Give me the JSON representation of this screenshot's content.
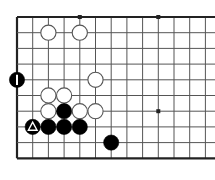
{
  "diagram": {
    "type": "go-board",
    "board": {
      "background_color": "#ffffff",
      "line_color": "#555555",
      "edge_line_color": "#222222",
      "edge_line_width": 2.2,
      "line_width": 1.0,
      "spacing": 15.7,
      "origin_x": 17,
      "origin_y": 17,
      "cols": 13,
      "rows": 10,
      "left_edge": true,
      "top_edge": true,
      "bottom_edge": true,
      "right_edge": false
    },
    "star_points": [
      {
        "col": 4,
        "row": 0
      },
      {
        "col": 9,
        "row": 0
      },
      {
        "col": 9,
        "row": 6
      }
    ],
    "star_point_radius": 2.0,
    "stone_radius": 7.6,
    "colors": {
      "black_stone": "#000000",
      "white_stone": "#ffffff",
      "white_stone_border": "#555555",
      "mark_on_black": "#ffffff",
      "star_point": "#222222"
    },
    "stones": [
      {
        "id": "w-c2r1",
        "color": "white",
        "col": 2,
        "row": 1,
        "mark": "none"
      },
      {
        "id": "w-c4r1",
        "color": "white",
        "col": 4,
        "row": 1,
        "mark": "none"
      },
      {
        "id": "b-c0r4",
        "color": "black",
        "col": 0,
        "row": 4,
        "mark": "bar"
      },
      {
        "id": "w-c5r4",
        "color": "white",
        "col": 5,
        "row": 4,
        "mark": "none"
      },
      {
        "id": "w-c2r5",
        "color": "white",
        "col": 2,
        "row": 5,
        "mark": "none"
      },
      {
        "id": "w-c3r5",
        "color": "white",
        "col": 3,
        "row": 5,
        "mark": "none"
      },
      {
        "id": "w-c2r6",
        "color": "white",
        "col": 2,
        "row": 6,
        "mark": "none"
      },
      {
        "id": "b-c3r6",
        "color": "black",
        "col": 3,
        "row": 6,
        "mark": "none"
      },
      {
        "id": "w-c4r6",
        "color": "white",
        "col": 4,
        "row": 6,
        "mark": "none"
      },
      {
        "id": "w-c5r6",
        "color": "white",
        "col": 5,
        "row": 6,
        "mark": "none"
      },
      {
        "id": "b-c1r7",
        "color": "black",
        "col": 1,
        "row": 7,
        "mark": "triangle"
      },
      {
        "id": "b-c2r7",
        "color": "black",
        "col": 2,
        "row": 7,
        "mark": "none"
      },
      {
        "id": "b-c3r7",
        "color": "black",
        "col": 3,
        "row": 7,
        "mark": "none"
      },
      {
        "id": "b-c4r7",
        "color": "black",
        "col": 4,
        "row": 7,
        "mark": "none"
      },
      {
        "id": "b-c6r8",
        "color": "black",
        "col": 6,
        "row": 8,
        "mark": "none"
      }
    ]
  }
}
